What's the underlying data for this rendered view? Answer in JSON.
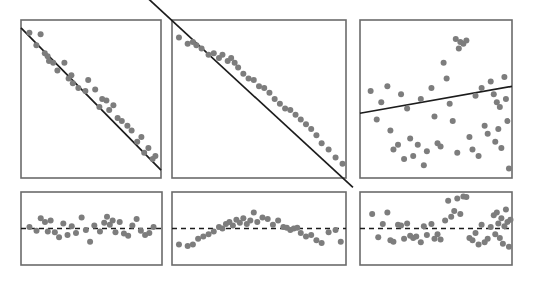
{
  "figure": {
    "title": "",
    "layout": "2 rows x 3 columns",
    "row_labels": [
      "scatter with fitted line",
      "residual plot"
    ],
    "background_color": "#ffffff",
    "point_color": "#7d7d7d",
    "line_color": "#1c1c1c",
    "frame_color": "#6b6b6b",
    "point_radius": 3.0
  },
  "chart_data": [
    {
      "type": "scatter",
      "name": "panel-1-scatter",
      "title": "",
      "xlabel": "",
      "ylabel": "",
      "grid": false,
      "legend": "none",
      "xlim": [
        0,
        100
      ],
      "ylim": [
        0,
        100
      ],
      "relationship": "strong negative linear",
      "fit_line": {
        "x": [
          0,
          100
        ],
        "y": [
          95,
          5
        ]
      },
      "x": [
        6,
        14,
        11,
        17,
        19,
        20,
        23,
        26,
        31,
        34,
        36,
        37,
        41,
        46,
        48,
        53,
        56,
        58,
        61,
        63,
        66,
        69,
        72,
        76,
        79,
        83,
        86,
        88,
        91,
        94,
        96
      ],
      "y": [
        92,
        91,
        84,
        79,
        77,
        74,
        73,
        68,
        73,
        63,
        65,
        60,
        57,
        55,
        62,
        56,
        45,
        50,
        49,
        43,
        46,
        38,
        36,
        33,
        30,
        23,
        26,
        16,
        19,
        12,
        14
      ]
    },
    {
      "type": "scatter",
      "name": "panel-2-scatter",
      "title": "",
      "xlabel": "",
      "ylabel": "",
      "grid": false,
      "legend": "none",
      "xlim": [
        0,
        100
      ],
      "ylim": [
        0,
        100
      ],
      "relationship": "very strong negative linear",
      "fit_line": {
        "x": [
          -22,
          104
        ],
        "y": [
          122,
          -6
        ]
      },
      "x": [
        4,
        9,
        12,
        14,
        17,
        21,
        24,
        27,
        29,
        32,
        34,
        36,
        38,
        41,
        44,
        47,
        50,
        53,
        56,
        59,
        62,
        65,
        68,
        71,
        74,
        77,
        80,
        83,
        86,
        90,
        94,
        98
      ],
      "y": [
        89,
        85,
        86,
        84,
        82,
        78,
        79,
        76,
        78,
        74,
        76,
        73,
        70,
        66,
        63,
        62,
        58,
        57,
        54,
        50,
        47,
        44,
        43,
        40,
        37,
        34,
        31,
        27,
        22,
        18,
        13,
        9
      ]
    },
    {
      "type": "scatter",
      "name": "panel-3-scatter",
      "title": "",
      "xlabel": "",
      "ylabel": "",
      "grid": false,
      "legend": "none",
      "xlim": [
        0,
        100
      ],
      "ylim": [
        0,
        100
      ],
      "relationship": "weak positive / no clear linear relationship",
      "fit_line": {
        "x": [
          0,
          100
        ],
        "y": [
          41,
          58
        ]
      },
      "x": [
        7,
        11,
        14,
        18,
        20,
        22,
        25,
        27,
        29,
        31,
        33,
        35,
        38,
        40,
        42,
        44,
        47,
        49,
        51,
        53,
        55,
        57,
        59,
        61,
        63,
        64,
        65,
        66,
        68,
        70,
        72,
        74,
        76,
        78,
        80,
        82,
        84,
        86,
        88,
        89,
        90,
        91,
        92,
        93,
        95,
        96,
        97,
        98
      ],
      "y": [
        55,
        37,
        48,
        58,
        30,
        18,
        21,
        53,
        12,
        44,
        25,
        14,
        21,
        50,
        8,
        17,
        57,
        39,
        22,
        20,
        73,
        63,
        47,
        36,
        88,
        16,
        82,
        86,
        85,
        87,
        26,
        18,
        52,
        14,
        57,
        33,
        28,
        61,
        53,
        23,
        48,
        31,
        45,
        19,
        64,
        50,
        36,
        6
      ]
    },
    {
      "type": "scatter",
      "name": "panel-1-residuals",
      "title": "",
      "xlabel": "",
      "ylabel": "",
      "grid": false,
      "legend": "none",
      "xlim": [
        0,
        100
      ],
      "ylim": [
        -50,
        50
      ],
      "relationship": "random scatter about zero (good linear fit)",
      "zero_line": {
        "x": [
          0,
          100
        ],
        "y": [
          0,
          0
        ]
      },
      "x": [
        6,
        11,
        14,
        17,
        19,
        21,
        24,
        27,
        30,
        33,
        36,
        39,
        43,
        46,
        49,
        52,
        56,
        59,
        61,
        63,
        65,
        67,
        70,
        73,
        76,
        79,
        82,
        85,
        88,
        91,
        94
      ],
      "y": [
        2,
        -3,
        14,
        9,
        -4,
        11,
        -5,
        -12,
        7,
        -9,
        3,
        -6,
        15,
        -2,
        -18,
        4,
        -4,
        8,
        16,
        5,
        11,
        -5,
        9,
        -7,
        -10,
        4,
        13,
        -3,
        -9,
        -6,
        2
      ]
    },
    {
      "type": "scatter",
      "name": "panel-2-residuals",
      "title": "",
      "xlabel": "",
      "ylabel": "",
      "grid": false,
      "legend": "none",
      "xlim": [
        0,
        100
      ],
      "ylim": [
        -50,
        50
      ],
      "relationship": "curved arch pattern (non-linearity present)",
      "zero_line": {
        "x": [
          0,
          100
        ],
        "y": [
          0,
          0
        ]
      },
      "x": [
        4,
        9,
        12,
        15,
        18,
        21,
        24,
        27,
        29,
        31,
        33,
        35,
        37,
        39,
        41,
        43,
        45,
        47,
        49,
        52,
        55,
        58,
        61,
        64,
        66,
        68,
        70,
        72,
        74,
        77,
        80,
        83,
        86,
        90,
        94,
        97
      ],
      "y": [
        -22,
        -24,
        -22,
        -14,
        -11,
        -8,
        -4,
        2,
        0,
        6,
        9,
        4,
        12,
        8,
        14,
        6,
        11,
        22,
        9,
        15,
        13,
        5,
        11,
        2,
        1,
        -2,
        0,
        1,
        -6,
        -11,
        -9,
        -16,
        -20,
        -5,
        -2,
        -18
      ]
    },
    {
      "type": "scatter",
      "name": "panel-3-residuals",
      "title": "",
      "xlabel": "",
      "ylabel": "",
      "grid": false,
      "legend": "none",
      "xlim": [
        0,
        100
      ],
      "ylim": [
        -50,
        50
      ],
      "relationship": "unstructured spread, increasing variability at right",
      "zero_line": {
        "x": [
          0,
          100
        ],
        "y": [
          0,
          0
        ]
      },
      "x": [
        8,
        12,
        15,
        18,
        20,
        22,
        25,
        27,
        29,
        31,
        33,
        35,
        37,
        40,
        42,
        44,
        47,
        49,
        51,
        53,
        56,
        58,
        60,
        62,
        64,
        66,
        68,
        70,
        72,
        74,
        76,
        78,
        80,
        82,
        84,
        86,
        88,
        89,
        90,
        91,
        92,
        93,
        94,
        95,
        96,
        97,
        98,
        99
      ],
      "y": [
        20,
        -12,
        6,
        22,
        -16,
        -18,
        5,
        4,
        -14,
        7,
        -10,
        -13,
        -11,
        -19,
        3,
        -9,
        6,
        -14,
        -8,
        -15,
        11,
        38,
        16,
        24,
        41,
        20,
        44,
        43,
        -13,
        -16,
        -6,
        -22,
        5,
        -19,
        -14,
        2,
        18,
        -8,
        22,
        7,
        -13,
        14,
        -21,
        3,
        26,
        9,
        -25,
        12
      ]
    }
  ],
  "panels": [
    {
      "name": "panel-1-scatter",
      "x": 21,
      "y": 20,
      "width": 140,
      "height": 158
    },
    {
      "name": "panel-2-scatter",
      "x": 172,
      "y": 20,
      "width": 174,
      "height": 158
    },
    {
      "name": "panel-3-scatter",
      "x": 360,
      "y": 20,
      "width": 152,
      "height": 158
    },
    {
      "name": "panel-1-residuals",
      "x": 21,
      "y": 192,
      "width": 141,
      "height": 73
    },
    {
      "name": "panel-2-residuals",
      "x": 172,
      "y": 192,
      "width": 174,
      "height": 73
    },
    {
      "name": "panel-3-residuals",
      "x": 360,
      "y": 192,
      "width": 152,
      "height": 73
    }
  ]
}
